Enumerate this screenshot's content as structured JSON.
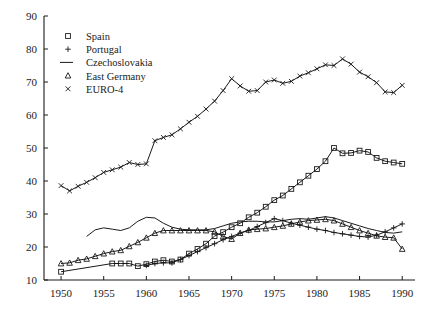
{
  "chart_data": {
    "type": "line",
    "title": "",
    "xlabel": "",
    "ylabel": "",
    "xlim": [
      1948,
      1991.5
    ],
    "ylim": [
      10,
      90
    ],
    "xticks": [
      1950,
      1955,
      1960,
      1965,
      1970,
      1975,
      1980,
      1985,
      1990
    ],
    "yticks": [
      10,
      20,
      30,
      40,
      50,
      60,
      70,
      80,
      90
    ],
    "grid": false,
    "legend_position": "upper-left-inside",
    "series": [
      {
        "name": "Spain",
        "marker": "square",
        "legend_label": "Spain",
        "x": [
          1950,
          1956,
          1957,
          1958,
          1959,
          1960,
          1961,
          1962,
          1963,
          1964,
          1965,
          1966,
          1967,
          1968,
          1969,
          1970,
          1971,
          1972,
          1973,
          1974,
          1975,
          1976,
          1977,
          1978,
          1979,
          1980,
          1981,
          1982,
          1983,
          1984,
          1985,
          1986,
          1987,
          1988,
          1989,
          1990
        ],
        "values": [
          12.5,
          15.0,
          15.0,
          15.0,
          14.2,
          14.8,
          15.6,
          16.0,
          15.6,
          16.2,
          18.0,
          19.4,
          21.0,
          23.3,
          24.5,
          26.0,
          27.2,
          29.0,
          30.4,
          32.2,
          34.2,
          35.6,
          37.6,
          39.6,
          41.6,
          43.6,
          46.0,
          50.0,
          48.4,
          48.5,
          49.2,
          48.8,
          47.0,
          46.0,
          45.6,
          45.2
        ]
      },
      {
        "name": "Portugal",
        "marker": "plus",
        "legend_label": "Portugal",
        "x": [
          1960,
          1961,
          1962,
          1963,
          1964,
          1965,
          1966,
          1967,
          1968,
          1969,
          1970,
          1971,
          1972,
          1973,
          1974,
          1975,
          1976,
          1977,
          1978,
          1979,
          1980,
          1981,
          1982,
          1983,
          1984,
          1985,
          1986,
          1987,
          1988,
          1989,
          1990
        ],
        "values": [
          14.4,
          15.0,
          15.2,
          15.2,
          16.2,
          17.4,
          18.6,
          19.8,
          21.0,
          22.2,
          23.2,
          24.2,
          25.0,
          26.2,
          27.4,
          28.6,
          28.0,
          27.2,
          26.6,
          26.0,
          25.4,
          25.0,
          24.4,
          24.0,
          23.6,
          23.2,
          23.0,
          23.6,
          24.6,
          25.8,
          27.0
        ]
      },
      {
        "name": "Czechoslovakia",
        "marker": "none",
        "legend_label": "Czechoslovakia",
        "x": [
          1953,
          1954,
          1955,
          1956,
          1957,
          1958,
          1959,
          1960,
          1961,
          1962,
          1963,
          1964,
          1965,
          1966,
          1967,
          1968,
          1969,
          1970,
          1971,
          1972,
          1973,
          1974,
          1975,
          1976,
          1977,
          1978,
          1979,
          1980,
          1981,
          1982,
          1983,
          1984,
          1985,
          1986,
          1987,
          1988,
          1989,
          1990
        ],
        "values": [
          23.2,
          25.2,
          25.8,
          25.4,
          25.0,
          25.8,
          27.8,
          29.0,
          28.8,
          27.2,
          26.0,
          25.4,
          25.2,
          25.2,
          25.2,
          25.6,
          26.4,
          27.2,
          27.6,
          27.8,
          27.8,
          27.6,
          27.6,
          28.0,
          28.4,
          28.6,
          28.4,
          28.8,
          29.2,
          28.8,
          28.0,
          27.2,
          26.4,
          25.6,
          25.0,
          24.4,
          24.2,
          24.6
        ]
      },
      {
        "name": "East Germany",
        "marker": "triangle",
        "legend_label": "East Germany",
        "x": [
          1950,
          1951,
          1952,
          1953,
          1954,
          1955,
          1956,
          1957,
          1958,
          1959,
          1960,
          1961,
          1962,
          1963,
          1964,
          1965,
          1966,
          1967,
          1968,
          1969,
          1970,
          1971,
          1972,
          1973,
          1974,
          1975,
          1976,
          1977,
          1978,
          1979,
          1980,
          1981,
          1982,
          1983,
          1984,
          1985,
          1986,
          1987,
          1988,
          1989,
          1990
        ],
        "values": [
          15.0,
          15.2,
          16.0,
          16.4,
          17.2,
          18.0,
          18.6,
          19.0,
          20.2,
          21.4,
          22.8,
          24.2,
          25.0,
          25.0,
          25.0,
          25.0,
          25.0,
          25.0,
          24.6,
          23.2,
          22.4,
          24.2,
          25.2,
          25.4,
          25.6,
          26.0,
          26.4,
          27.0,
          27.6,
          28.0,
          28.2,
          28.4,
          28.0,
          27.0,
          26.0,
          25.0,
          24.2,
          23.4,
          23.0,
          22.8,
          19.4
        ]
      },
      {
        "name": "EURO-4",
        "marker": "x",
        "legend_label": "EURO-4",
        "x": [
          1950,
          1951,
          1952,
          1953,
          1954,
          1955,
          1956,
          1957,
          1958,
          1959,
          1960,
          1961,
          1962,
          1963,
          1964,
          1965,
          1966,
          1967,
          1968,
          1969,
          1970,
          1971,
          1972,
          1973,
          1974,
          1975,
          1976,
          1977,
          1978,
          1979,
          1980,
          1981,
          1982,
          1983,
          1984,
          1985,
          1986,
          1987,
          1988,
          1989,
          1990
        ],
        "values": [
          38.6,
          37.0,
          38.4,
          39.6,
          41.0,
          42.6,
          43.4,
          44.2,
          45.6,
          45.0,
          45.2,
          52.2,
          53.2,
          54.0,
          55.8,
          57.8,
          59.6,
          61.8,
          64.2,
          67.4,
          71.0,
          68.8,
          67.2,
          67.4,
          70.0,
          70.6,
          69.6,
          70.2,
          71.8,
          72.8,
          74.0,
          75.2,
          75.0,
          77.0,
          75.4,
          73.0,
          71.6,
          69.8,
          67.0,
          66.8,
          69.0
        ]
      }
    ],
    "legend_entries": [
      {
        "label": "Spain",
        "marker": "square"
      },
      {
        "label": "Portugal",
        "marker": "plus"
      },
      {
        "label": "Czechoslovakia",
        "marker": "line"
      },
      {
        "label": "East Germany",
        "marker": "triangle"
      },
      {
        "label": "EURO-4",
        "marker": "x"
      }
    ],
    "colors": {
      "ink": "#1a1a1a",
      "background": "#ffffff"
    }
  }
}
